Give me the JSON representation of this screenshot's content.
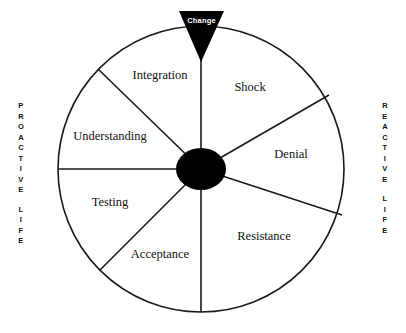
{
  "diagram": {
    "title_marker": {
      "label": "Change",
      "shape": "down-triangle",
      "color": "#000000",
      "text_color": "#ffffff"
    },
    "axes": {
      "left": {
        "line1": "PROACTIVE",
        "line2": "LIFE"
      },
      "right": {
        "line1": "REACTIVE",
        "line2": "LIFE"
      }
    },
    "wheel": {
      "center_color": "#000000",
      "stroke_color": "#1a1a1a",
      "segments": [
        {
          "name": "shock",
          "label": "Shock",
          "label_x": 250,
          "label_y": 88,
          "anchor": "middle"
        },
        {
          "name": "denial",
          "label": "Denial",
          "label_x": 291,
          "label_y": 155,
          "anchor": "middle"
        },
        {
          "name": "resistance",
          "label": "Resistance",
          "label_x": 264,
          "label_y": 237,
          "anchor": "middle"
        },
        {
          "name": "acceptance",
          "label": "Acceptance",
          "label_x": 160,
          "label_y": 255,
          "anchor": "middle"
        },
        {
          "name": "testing",
          "label": "Testing",
          "label_x": 110,
          "label_y": 203,
          "anchor": "middle"
        },
        {
          "name": "understanding",
          "label": "Understanding",
          "label_x": 110,
          "label_y": 137,
          "anchor": "middle"
        },
        {
          "name": "integration",
          "label": "Integration",
          "label_x": 160,
          "label_y": 76,
          "anchor": "middle"
        }
      ]
    }
  }
}
